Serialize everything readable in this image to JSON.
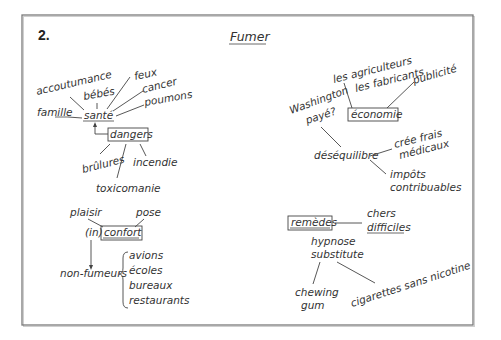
{
  "header": {
    "number": "2.",
    "title": "Fumer"
  },
  "clusters": {
    "sante": {
      "center": "santé",
      "box": "dangers",
      "branches": [
        "accoutumance",
        "bébés",
        "feux",
        "cancer",
        "poumons",
        "famille"
      ],
      "danger_branches": [
        "brûlures",
        "incendie",
        "toxicomanie"
      ]
    },
    "economie": {
      "center": "économie",
      "branches": [
        "les agriculteurs",
        "les fabricants",
        "publicité",
        "Washington",
        "payé?"
      ],
      "sub_center": "déséquilibre",
      "sub_branches": [
        "crée frais",
        "médicaux",
        "impôts",
        "contribuables"
      ]
    },
    "confort": {
      "prefix": "(in)",
      "center": "confort",
      "branches": [
        "plaisir",
        "pose"
      ],
      "arrow_target": "non-fumeurs",
      "places": [
        "avions",
        "écoles",
        "bureaux",
        "restaurants"
      ]
    },
    "remedes": {
      "center": "remèdes",
      "branches": [
        "chers",
        "difficiles"
      ],
      "methods": [
        "hypnose",
        "substitute"
      ],
      "substitutes": [
        "chewing",
        "gum",
        "cigarettes sans nicotine"
      ]
    }
  }
}
